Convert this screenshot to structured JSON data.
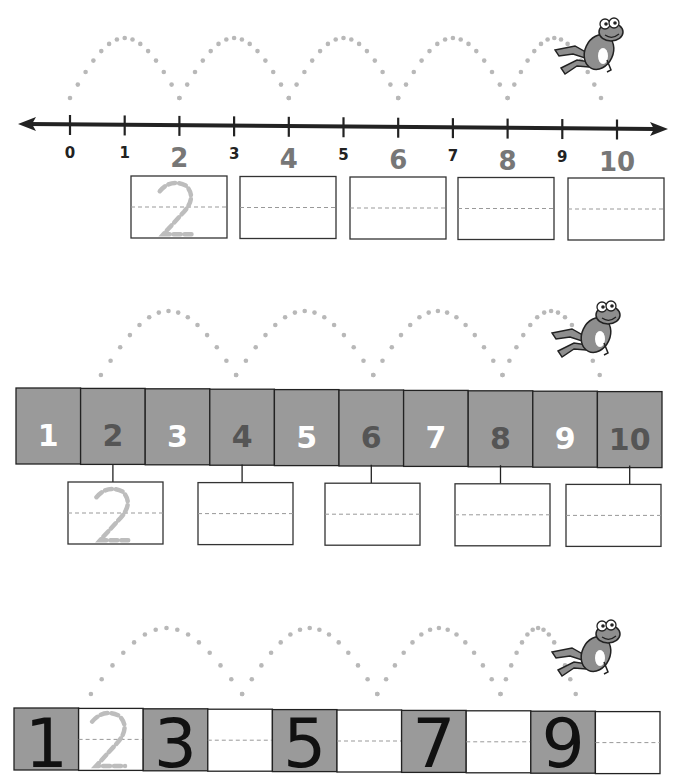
{
  "worksheet": {
    "section1": {
      "type": "number-line",
      "ticks": [
        {
          "label": "0",
          "emphasis": false
        },
        {
          "label": "1",
          "emphasis": false
        },
        {
          "label": "2",
          "emphasis": true
        },
        {
          "label": "3",
          "emphasis": false
        },
        {
          "label": "4",
          "emphasis": true
        },
        {
          "label": "5",
          "emphasis": false
        },
        {
          "label": "6",
          "emphasis": true
        },
        {
          "label": "7",
          "emphasis": false
        },
        {
          "label": "8",
          "emphasis": true
        },
        {
          "label": "9",
          "emphasis": false
        },
        {
          "label": "10",
          "emphasis": true
        }
      ],
      "answer_boxes": [
        {
          "traced": "2"
        },
        {
          "traced": ""
        },
        {
          "traced": ""
        },
        {
          "traced": ""
        },
        {
          "traced": ""
        }
      ]
    },
    "section2": {
      "type": "number-strip",
      "cells": [
        {
          "label": "1",
          "color": "#ffffff"
        },
        {
          "label": "2",
          "color": "#555555"
        },
        {
          "label": "3",
          "color": "#ffffff"
        },
        {
          "label": "4",
          "color": "#555555"
        },
        {
          "label": "5",
          "color": "#ffffff"
        },
        {
          "label": "6",
          "color": "#555555"
        },
        {
          "label": "7",
          "color": "#ffffff"
        },
        {
          "label": "8",
          "color": "#555555"
        },
        {
          "label": "9",
          "color": "#ffffff"
        },
        {
          "label": "10",
          "color": "#555555"
        }
      ],
      "answer_boxes": [
        {
          "traced": "2"
        },
        {
          "traced": ""
        },
        {
          "traced": ""
        },
        {
          "traced": ""
        },
        {
          "traced": ""
        }
      ]
    },
    "section3": {
      "type": "writing-strip",
      "cells": [
        {
          "label": "1",
          "filled": true
        },
        {
          "label": "2",
          "filled": false,
          "traced": true
        },
        {
          "label": "3",
          "filled": true
        },
        {
          "label": "",
          "filled": false
        },
        {
          "label": "5",
          "filled": true
        },
        {
          "label": "",
          "filled": false
        },
        {
          "label": "7",
          "filled": true
        },
        {
          "label": "",
          "filled": false
        },
        {
          "label": "9",
          "filled": true
        },
        {
          "label": "",
          "filled": false
        }
      ]
    },
    "colors": {
      "cell_fill": "#9a9a9a",
      "dots": "#b8b8b8",
      "line": "#222222",
      "trace": "#bdbdbd",
      "frog": "#8e8e8e"
    }
  }
}
